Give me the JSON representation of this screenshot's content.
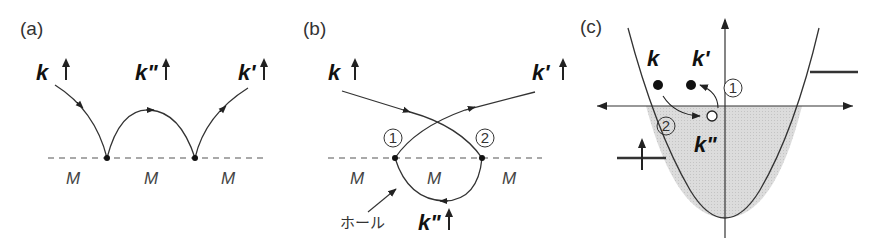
{
  "figure": {
    "panels": [
      {
        "id": "a",
        "label": "(a)",
        "states": [
          "k",
          "k\"",
          "k'"
        ],
        "spin_symbol": "↑",
        "impurity_labels": [
          "M",
          "M",
          "M"
        ]
      },
      {
        "id": "b",
        "label": "(b)",
        "states": [
          "k",
          "k'",
          "k\""
        ],
        "spin_symbol": "↑",
        "impurity_labels": [
          "M",
          "M",
          "M"
        ],
        "vertex_labels": [
          "1",
          "2"
        ],
        "hole_label": "ホール"
      },
      {
        "id": "c",
        "label": "(c)",
        "states": [
          "k",
          "k'",
          "k\""
        ],
        "step_labels": [
          "1",
          "2"
        ]
      }
    ],
    "colors": {
      "line": "#333333",
      "fill_occupied": "#d9d9d9",
      "dashed": "#555555"
    }
  }
}
